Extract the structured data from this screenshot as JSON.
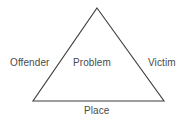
{
  "diagram": {
    "name": "problem-analysis-triangle",
    "shape": "triangle",
    "stroke_color": "#3c3c3c",
    "text_color": "#4a4a4a",
    "background_color": "#ffffff",
    "vertices": {
      "apex": [
        97,
        8
      ],
      "bottom_left": [
        33,
        101
      ],
      "bottom_right": [
        164,
        101
      ]
    },
    "labels": {
      "left": "Offender",
      "center": "Problem",
      "right": "Victim",
      "bottom": "Place"
    }
  }
}
